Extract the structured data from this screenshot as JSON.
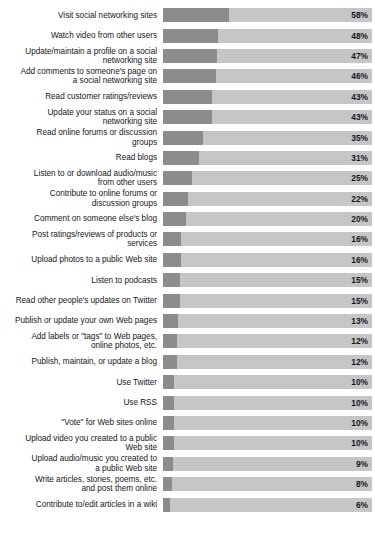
{
  "chart_data": {
    "type": "bar",
    "title": "",
    "subtitle": "",
    "xlabel": "",
    "ylabel": "",
    "orientation": "horizontal",
    "value_suffix": "%",
    "xlim": [
      0,
      100
    ],
    "grid": false,
    "legend": null,
    "bar_track_background": "#c6c6c6",
    "bar_fill_color": "#8c8c8c",
    "categories": [
      "Visit social networking sites",
      "Watch video from other users",
      "Update/maintain a profile on a social\nnetworking site",
      "Add comments to someone's page on\na social networking site",
      "Read customer ratings/reviews",
      "Update your status on a social\nnetworking site",
      "Read online forums or discussion\ngroups",
      "Read blogs",
      "Listen to or download audio/music\nfrom other users",
      "Contribute to online forums or\ndiscussion groups",
      "Comment on someone else's blog",
      "Post ratings/reviews of products or\nservices",
      "Upload photos to a public Web site",
      "Listen to podcasts",
      "Read other people's updates on Twitter",
      "Publish or update your own Web pages",
      "Add labels or \"tags\" to Web pages,\nonline photos, etc.",
      "Publish, maintain, or update a blog",
      "Use Twitter",
      "Use RSS",
      "\"Vote\" for Web sites online",
      "Upload video you created to a public\nWeb site",
      "Upload audio/music you created to\na public Web site",
      "Write articles, stories, poems, etc.\nand post them online",
      "Contribute to/edit articles in a wiki"
    ],
    "values": [
      58,
      48,
      47,
      46,
      43,
      43,
      35,
      31,
      25,
      22,
      20,
      16,
      16,
      15,
      15,
      13,
      12,
      12,
      10,
      10,
      10,
      10,
      9,
      8,
      6
    ],
    "value_labels": [
      "58%",
      "48%",
      "47%",
      "46%",
      "43%",
      "43%",
      "35%",
      "31%",
      "25%",
      "22%",
      "20%",
      "16%",
      "16%",
      "15%",
      "15%",
      "13%",
      "12%",
      "12%",
      "10%",
      "10%",
      "10%",
      "10%",
      "9%",
      "8%",
      "6%"
    ]
  }
}
